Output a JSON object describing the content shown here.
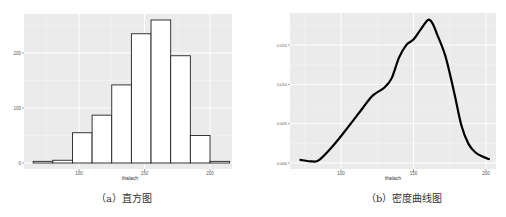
{
  "chart_data": [
    {
      "type": "bar",
      "subtype": "histogram",
      "title": "",
      "caption": "（a）直方图",
      "xlabel": "thalach",
      "ylabel": "",
      "bin_edges": [
        65,
        80,
        95,
        110,
        125,
        140,
        155,
        170,
        185,
        200,
        215
      ],
      "values": [
        3,
        5,
        55,
        87,
        142,
        235,
        260,
        195,
        50,
        3
      ],
      "xticks": [
        100,
        150,
        200
      ],
      "yticks": [
        0,
        100,
        200
      ],
      "xlim": [
        58,
        218
      ],
      "ylim": [
        0,
        270
      ],
      "grid": true,
      "bar_fill": "#ffffff",
      "bar_edge": "#222222",
      "panel_bg": "#ebebeb"
    },
    {
      "type": "line",
      "subtype": "density",
      "title": "",
      "caption": "（b）密度曲线图",
      "xlabel": "thalach",
      "ylabel": "",
      "x": [
        72,
        80,
        85,
        95,
        105,
        115,
        122,
        130,
        135,
        140,
        145,
        150,
        155,
        160,
        163,
        166,
        172,
        178,
        183,
        188,
        193,
        198,
        202
      ],
      "y": [
        0.0004,
        0.0002,
        0.0004,
        0.0023,
        0.0046,
        0.007,
        0.0086,
        0.0096,
        0.0108,
        0.0134,
        0.015,
        0.0157,
        0.017,
        0.0182,
        0.0178,
        0.0165,
        0.0136,
        0.009,
        0.0048,
        0.0024,
        0.0013,
        0.0008,
        0.0005
      ],
      "xticks": [
        100,
        150,
        200
      ],
      "yticks": [
        0.0,
        0.005,
        0.01,
        0.015
      ],
      "ytick_labels": [
        "0.000",
        "0.005",
        "0.010",
        "0.015"
      ],
      "xlim": [
        66,
        206
      ],
      "ylim": [
        0,
        0.019
      ],
      "grid": true,
      "line_color": "#000000",
      "panel_bg": "#ebebeb"
    }
  ],
  "captions": {
    "a": "（a）直方图",
    "b": "（b）密度曲线图"
  }
}
